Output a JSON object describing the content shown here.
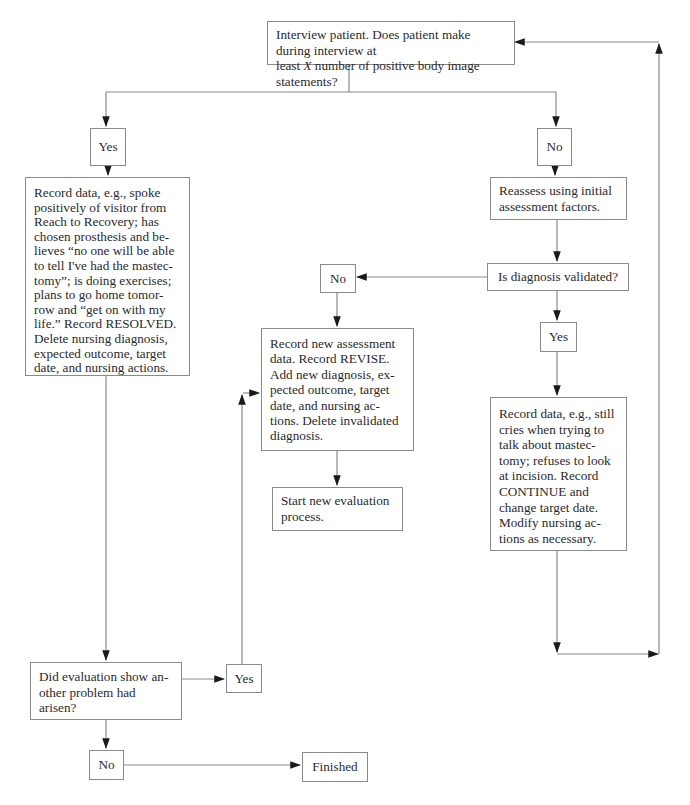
{
  "flowchart": {
    "start": {
      "text": "Interview patient. Does patient make during interview at least X number of positive body image statements?",
      "line1": "Interview patient. Does patient make during interview at",
      "line2_pre": "least ",
      "line2_var": "X",
      "line2_post": " number of positive body image statements?"
    },
    "yes_top": "Yes",
    "no_top": "No",
    "resolved_box": "Record data, e.g., spoke positively of visitor from Reach to Recovery; has chosen prosthesis and be-lieves “no one will be able to tell I've had the mastec-tomy”; is doing exercises; plans to go home tomor-row and “get on with my life.” Record RESOLVED. Delete nursing diagnosis, expected outcome, target date, and nursing actions.",
    "reassess_box": "Reassess using initial assessment factors.",
    "validated_question": "Is diagnosis validated?",
    "no_middle": "No",
    "yes_right": "Yes",
    "revise_box": "Record new assessment data. Record REVISE. Add new diagnosis, ex-pected outcome, target date, and nursing ac-tions. Delete invalidated diagnosis.",
    "start_new_box": "Start new evaluation process.",
    "continue_box": "Record data, e.g., still cries when trying to talk about mastec-tomy; refuses to look at incision. Record CONTINUE and change target date. Modify nursing ac-tions as necessary.",
    "another_problem_question": "Did evaluation show an-other problem  had arisen?",
    "yes_bottom": "Yes",
    "no_bottom": "No",
    "finished": "Finished"
  },
  "colors": {
    "line": "#8a8a8a",
    "arrowhead": "#1a1a1a",
    "text": "#2a2a2a"
  }
}
